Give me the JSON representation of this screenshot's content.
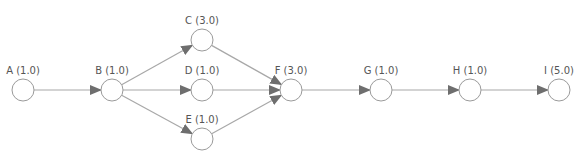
{
  "diagram": {
    "type": "network-flow",
    "colors": {
      "node_stroke": "#9a9a9a",
      "edge": "#a8a8a8",
      "arrowhead": "#6e6e6e",
      "label": "#555555"
    },
    "nodes": [
      {
        "id": "A",
        "label": "A (1.0)",
        "x": 23,
        "y": 90
      },
      {
        "id": "B",
        "label": "B (1.0)",
        "x": 112,
        "y": 90
      },
      {
        "id": "C",
        "label": "C (3.0)",
        "x": 202,
        "y": 40
      },
      {
        "id": "D",
        "label": "D (1.0)",
        "x": 202,
        "y": 90
      },
      {
        "id": "E",
        "label": "E (1.0)",
        "x": 202,
        "y": 139
      },
      {
        "id": "F",
        "label": "F (3.0)",
        "x": 291,
        "y": 90
      },
      {
        "id": "G",
        "label": "G (1.0)",
        "x": 381,
        "y": 90
      },
      {
        "id": "H",
        "label": "H (1.0)",
        "x": 470,
        "y": 90
      },
      {
        "id": "I",
        "label": "I (5.0)",
        "x": 559,
        "y": 90
      }
    ],
    "edges": [
      {
        "from": "A",
        "to": "B"
      },
      {
        "from": "B",
        "to": "C"
      },
      {
        "from": "B",
        "to": "D"
      },
      {
        "from": "B",
        "to": "E"
      },
      {
        "from": "C",
        "to": "F"
      },
      {
        "from": "D",
        "to": "F"
      },
      {
        "from": "E",
        "to": "F"
      },
      {
        "from": "F",
        "to": "G"
      },
      {
        "from": "G",
        "to": "H"
      },
      {
        "from": "H",
        "to": "I"
      }
    ]
  }
}
